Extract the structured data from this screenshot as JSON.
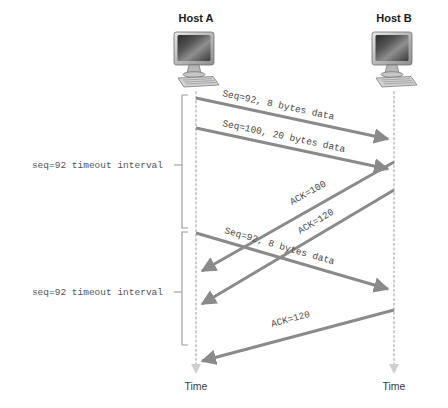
{
  "diagram": {
    "background": "#ffffff",
    "line_color": "#8a8a8a",
    "timeline_color": "#cfcfcf",
    "text_color": "#4a4a4a"
  },
  "hosts": [
    {
      "id": "host-a",
      "label": "Host A",
      "time_label": "Time",
      "x": 196
    },
    {
      "id": "host-b",
      "label": "Host B",
      "time_label": "Time",
      "x": 394
    }
  ],
  "messages": [
    {
      "id": "seq92-first",
      "label": "Seq=92, 8 bytes data",
      "direction": "a-to-b",
      "x1": 196,
      "y1": 98,
      "x2": 394,
      "y2": 140,
      "label_x": 222,
      "label_y": 96,
      "angle": 12.0
    },
    {
      "id": "seq100",
      "label": "Seq=100, 20 bytes data",
      "direction": "a-to-b",
      "x1": 196,
      "y1": 128,
      "x2": 394,
      "y2": 170,
      "label_x": 222,
      "label_y": 126,
      "angle": 12.0
    },
    {
      "id": "ack100",
      "label": "ACK=100",
      "direction": "b-to-a",
      "x1": 394,
      "y1": 162,
      "x2": 200,
      "y2": 272,
      "label_x": 292,
      "label_y": 205,
      "angle": 29.5
    },
    {
      "id": "ack120-first",
      "label": "ACK=120",
      "direction": "b-to-a",
      "x1": 394,
      "y1": 190,
      "x2": 200,
      "y2": 305,
      "label_x": 300,
      "label_y": 234,
      "angle": 30.6
    },
    {
      "id": "seq92-retransmit",
      "label": "Seq=92, 8 bytes data",
      "direction": "a-to-b",
      "x1": 196,
      "y1": 233,
      "x2": 394,
      "y2": 290,
      "label_x": 224,
      "label_y": 233,
      "angle": 16.0
    },
    {
      "id": "ack120-second",
      "label": "ACK=120",
      "direction": "b-to-a",
      "x1": 394,
      "y1": 310,
      "x2": 200,
      "y2": 362,
      "label_x": 272,
      "label_y": 327,
      "angle": 15.0
    }
  ],
  "intervals": [
    {
      "id": "timeout-1",
      "label": "seq=92 timeout interval",
      "label_x": 163,
      "label_y": 168,
      "bracket_x": 182,
      "bracket_top": 95,
      "bracket_bottom": 228,
      "tick_y": 165
    },
    {
      "id": "timeout-2",
      "label": "seq=92 timeout interval",
      "label_x": 163,
      "label_y": 295,
      "bracket_x": 182,
      "bracket_top": 232,
      "bracket_bottom": 345,
      "tick_y": 292
    }
  ],
  "timelines": {
    "top": 92,
    "bottom": 372
  }
}
